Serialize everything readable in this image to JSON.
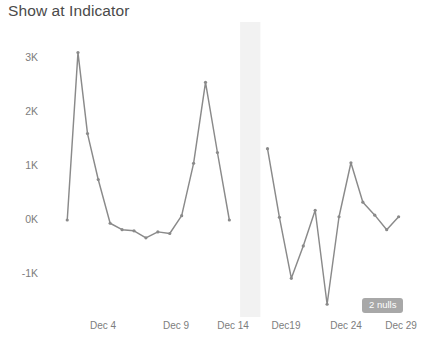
{
  "chart_data": {
    "type": "line",
    "title": "Show at Indicator",
    "xlabel": "",
    "ylabel": "",
    "grid": false,
    "legend": false,
    "ylim": [
      -1400,
      3300
    ],
    "ytick_labels": [
      "3K",
      "2K",
      "1K",
      "0K",
      "-1K"
    ],
    "ytick_values": [
      3000,
      2000,
      1000,
      0,
      -1000
    ],
    "xtick_labels": [
      "Dec 4",
      "Dec 9",
      "Dec 14",
      "Dec19",
      "Dec 24",
      "Dec 29"
    ],
    "xtick_values": [
      4,
      9,
      14,
      19,
      24,
      29
    ],
    "null_band": {
      "label": "2 nulls",
      "start_x": 15.5,
      "end_x": 17.2,
      "color": "#f2f2f2"
    },
    "annotations": [
      {
        "name": "nulls-badge",
        "text": "2 nulls"
      }
    ],
    "series": [
      {
        "name": "Show at Indicator",
        "color": "#8a8a8a",
        "segments": [
          {
            "name": "before-nulls",
            "x": [
              1.0,
              1.9,
              2.7,
              3.6,
              4.6,
              5.6,
              6.6,
              7.6,
              8.6,
              9.6,
              10.6,
              11.6,
              12.6,
              13.6,
              14.6
            ],
            "values": [
              0,
              3100,
              1600,
              750,
              -60,
              -180,
              -200,
              -330,
              -220,
              -250,
              80,
              1050,
              2550,
              1250,
              0
            ]
          },
          {
            "name": "after-nulls",
            "x": [
              17.8,
              18.8,
              19.8,
              20.8,
              21.8,
              22.8,
              23.8,
              24.8,
              25.8,
              26.8,
              27.8,
              28.8
            ],
            "values": [
              1320,
              50,
              -1080,
              -480,
              180,
              -1560,
              60,
              1060,
              330,
              90,
              -180,
              60
            ]
          }
        ]
      }
    ]
  }
}
